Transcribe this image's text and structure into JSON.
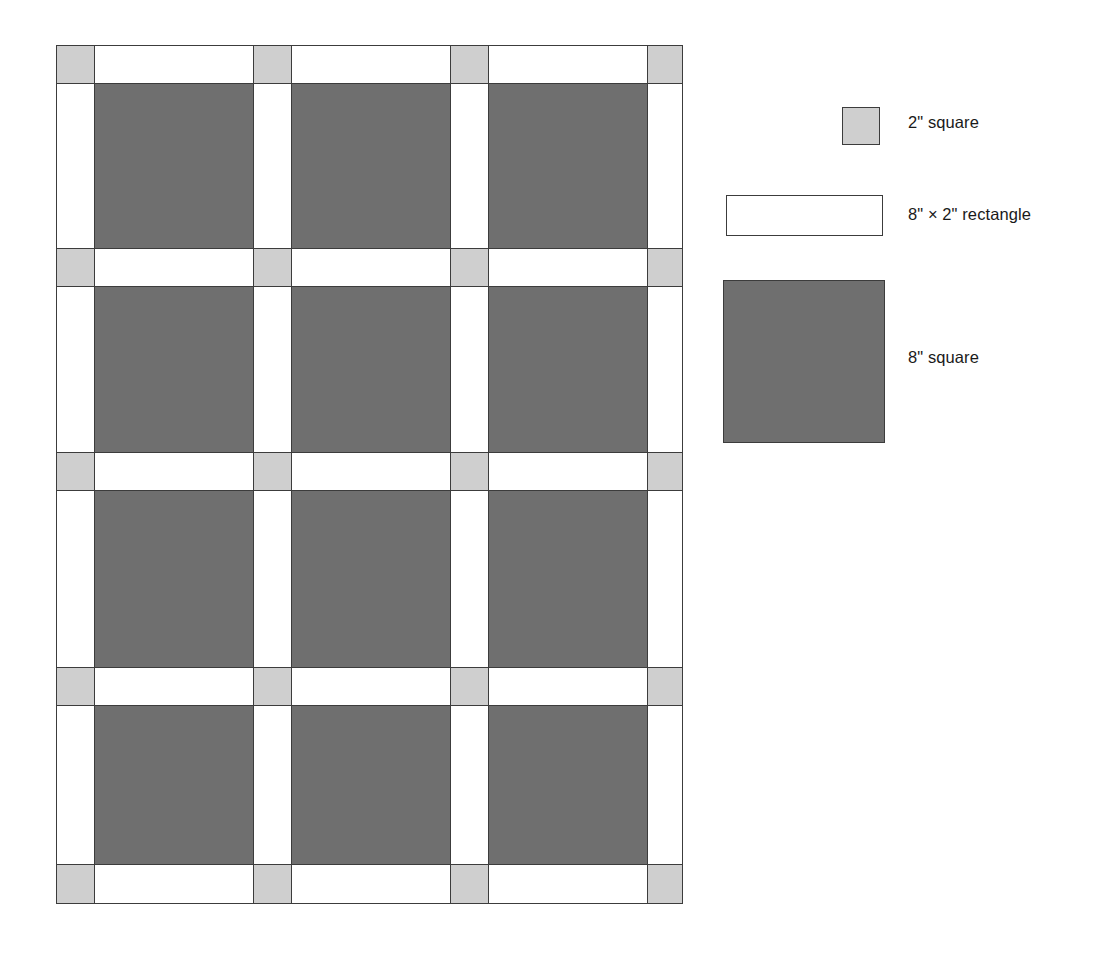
{
  "diagram": {
    "colors": {
      "small_square_fill": "#cfcfcf",
      "sashing_fill": "#ffffff",
      "big_square_fill": "#6f6f6f",
      "outline": "#3c3c3c",
      "background": "#ffffff",
      "text": "#1a1a1a"
    },
    "grid": {
      "columns": 7,
      "rows": 9,
      "column_kinds": [
        "corner",
        "block",
        "corner",
        "block",
        "corner",
        "block",
        "corner"
      ],
      "row_kinds": [
        "corner",
        "block",
        "corner",
        "block",
        "corner",
        "block",
        "corner",
        "block",
        "corner"
      ],
      "block_columns": 3,
      "block_rows": 4,
      "cells": [
        [
          "small-square",
          "sash",
          "small-square",
          "sash",
          "small-square",
          "sash",
          "small-square"
        ],
        [
          "sash",
          "big-square",
          "sash",
          "big-square",
          "sash",
          "big-square",
          "sash"
        ],
        [
          "small-square",
          "sash",
          "small-square",
          "sash",
          "small-square",
          "sash",
          "small-square"
        ],
        [
          "sash",
          "big-square",
          "sash",
          "big-square",
          "sash",
          "big-square",
          "sash"
        ],
        [
          "small-square",
          "sash",
          "small-square",
          "sash",
          "small-square",
          "sash",
          "small-square"
        ],
        [
          "sash",
          "big-square",
          "sash",
          "big-square",
          "sash",
          "big-square",
          "sash"
        ],
        [
          "small-square",
          "sash",
          "small-square",
          "sash",
          "small-square",
          "sash",
          "small-square"
        ],
        [
          "sash",
          "big-square",
          "sash",
          "big-square",
          "sash",
          "big-square",
          "sash"
        ],
        [
          "small-square",
          "sash",
          "small-square",
          "sash",
          "small-square",
          "sash",
          "small-square"
        ]
      ]
    }
  },
  "legend": {
    "items": [
      {
        "key": "small-square",
        "label": "2\" square",
        "swatch": "small-square"
      },
      {
        "key": "rectangle",
        "label": "8\" × 2\" rectangle",
        "swatch": "sash"
      },
      {
        "key": "big-square",
        "label": "8\" square",
        "swatch": "big-square"
      }
    ]
  }
}
